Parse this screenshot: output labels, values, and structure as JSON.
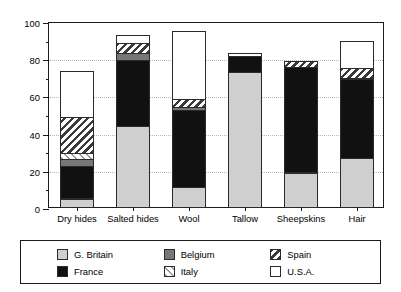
{
  "chart_data": {
    "type": "bar",
    "stacked": true,
    "title": "",
    "xlabel": "",
    "ylabel": "percentage of total item value",
    "ylim": [
      0,
      100
    ],
    "ytick_labels": [
      "0",
      "20",
      "40",
      "60",
      "80",
      "100"
    ],
    "ytick_values": [
      0,
      20,
      40,
      60,
      80,
      100
    ],
    "yminor_values": [
      10,
      30,
      50,
      70,
      90
    ],
    "grid": "horizontal-dotted",
    "legend_position": "bottom",
    "categories": [
      "Dry hides",
      "Salted hides",
      "Wool",
      "Tallow",
      "Sheepskins",
      "Hair"
    ],
    "series": [
      {
        "name": "G. Britain",
        "fill": "solid-light-gray",
        "color": "#cfcfcf",
        "values": [
          5,
          44,
          11,
          73,
          19,
          27
        ]
      },
      {
        "name": "France",
        "fill": "solid-black",
        "color": "#111111",
        "values": [
          18,
          36,
          42,
          9,
          57,
          43
        ]
      },
      {
        "name": "Belgium",
        "fill": "solid-dark-gray",
        "color": "#777777",
        "values": [
          4,
          4,
          2,
          0,
          0,
          0
        ]
      },
      {
        "name": "Italy",
        "fill": "hatch-forward",
        "color": "#9a9a9a",
        "values": [
          4,
          0,
          0,
          0,
          0,
          0
        ]
      },
      {
        "name": "Spain",
        "fill": "hatch-backward",
        "color": "#3a3a3a",
        "values": [
          20,
          6,
          5,
          0,
          4,
          6
        ]
      },
      {
        "name": "U.S.A.",
        "fill": "solid-white",
        "color": "#ffffff",
        "values": [
          25,
          5,
          37,
          2,
          0,
          15
        ]
      }
    ],
    "totals": [
      76,
      95,
      97,
      84,
      80,
      91
    ]
  },
  "legend": {
    "items": [
      {
        "label": "G. Britain"
      },
      {
        "label": "France"
      },
      {
        "label": "Belgium"
      },
      {
        "label": "Italy"
      },
      {
        "label": "Spain"
      },
      {
        "label": "U.S.A."
      }
    ]
  }
}
